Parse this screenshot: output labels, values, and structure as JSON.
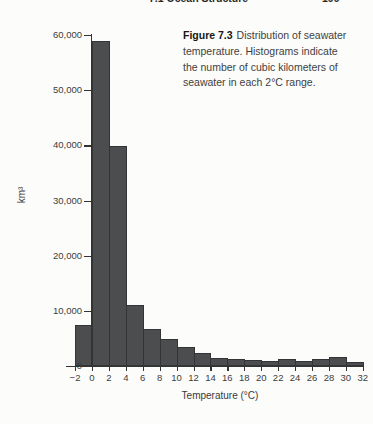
{
  "page": {
    "running_head": "7.1 Ocean Structure",
    "page_number": "199"
  },
  "figure": {
    "label": "Figure 7.3",
    "caption": "Distribution of seawater\ntemperature. Histograms indicate\nthe number of cubic kilometers of\nseawater in each 2°C range."
  },
  "chart_data": {
    "type": "bar",
    "xlabel": "Temperature (°C)",
    "ylabel": "km³",
    "bin_edges": [
      -2,
      0,
      2,
      4,
      6,
      8,
      10,
      12,
      14,
      16,
      18,
      20,
      22,
      24,
      26,
      28,
      30,
      32
    ],
    "values": [
      7400,
      59000,
      39800,
      11000,
      6700,
      4900,
      3400,
      2400,
      1500,
      1200,
      1000,
      850,
      1300,
      900,
      1250,
      1650,
      800
    ],
    "x_tick_labels": [
      "−2",
      "0",
      "2",
      "4",
      "6",
      "8",
      "10",
      "12",
      "14",
      "16",
      "18",
      "20",
      "22",
      "24",
      "26",
      "28",
      "30",
      "32"
    ],
    "y_ticks": [
      0,
      10000,
      20000,
      30000,
      40000,
      50000,
      60000
    ],
    "y_tick_labels": [
      "0",
      "10,000",
      "20,000",
      "30,000",
      "40,000",
      "50,000",
      "60,000"
    ],
    "ylim": [
      0,
      60000
    ],
    "grid": false,
    "legend": false,
    "bar_color": "#4b4d4e",
    "bar_border_color": "#323436",
    "axis_color": "#333333"
  }
}
